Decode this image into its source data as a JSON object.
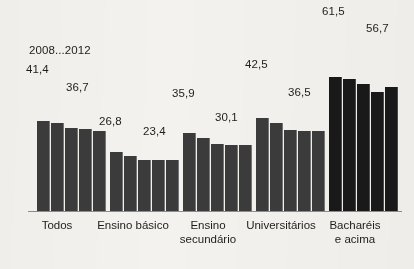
{
  "chart_data": {
    "type": "bar",
    "title": "",
    "subtitle": "",
    "xlabel": "",
    "ylabel": "",
    "legend": "2008...2012",
    "legend_position": "inside-top-left",
    "grid": false,
    "axis": {
      "baseline_visible": true,
      "y_axis_visible": false,
      "ylim": [
        0,
        70
      ]
    },
    "categories": [
      "Todos",
      "Ensino básico",
      "Ensino\nsecundário",
      "Universitários",
      "Bacharéis\ne acima"
    ],
    "series": [
      {
        "name": "2008",
        "values": [
          41.4,
          26.8,
          35.9,
          42.5,
          61.5
        ]
      },
      {
        "name": "2009",
        "values": [
          40.1,
          25.3,
          33.5,
          40.3,
          60.4
        ]
      },
      {
        "name": "2010",
        "values": [
          38.2,
          23.2,
          30.9,
          37.1,
          58.3
        ]
      },
      {
        "name": "2011",
        "values": [
          37.4,
          23.3,
          30.4,
          36.8,
          54.6
        ]
      },
      {
        "name": "2012",
        "values": [
          36.7,
          23.4,
          30.1,
          36.5,
          56.7
        ]
      }
    ],
    "groups": [
      {
        "category": "Todos",
        "dark": false,
        "first_label": "41,4",
        "last_label": "36,7",
        "values": [
          41.4,
          40.1,
          38.2,
          37.4,
          36.7
        ]
      },
      {
        "category": "Ensino básico",
        "dark": false,
        "first_label": "26,8",
        "last_label": "23,4",
        "values": [
          26.8,
          25.3,
          23.2,
          23.3,
          23.4
        ]
      },
      {
        "category": "Ensino secundário",
        "dark": false,
        "first_label": "35,9",
        "last_label": "30,1",
        "values": [
          35.9,
          33.5,
          30.9,
          30.4,
          30.1
        ]
      },
      {
        "category": "Universitários",
        "dark": false,
        "first_label": "42,5",
        "last_label": "36,5",
        "values": [
          42.5,
          40.3,
          37.1,
          36.8,
          36.5
        ]
      },
      {
        "category": "Bacharéis e acima",
        "dark": true,
        "first_label": "61,5",
        "last_label": "56,7",
        "values": [
          61.5,
          60.4,
          58.3,
          54.6,
          56.7
        ]
      }
    ],
    "colors": {
      "bar": "#3b3b3b",
      "bar_highlight": "#191919",
      "background": "#f4f2ee",
      "text": "#1d1d1d",
      "axis": "#8d8d8a"
    }
  },
  "labels": {
    "legend": "2008...2012",
    "v_41_4": "41,4",
    "v_36_7": "36,7",
    "v_26_8": "26,8",
    "v_23_4": "23,4",
    "v_35_9": "35,9",
    "v_30_1": "30,1",
    "v_42_5": "42,5",
    "v_36_5": "36,5",
    "v_61_5": "61,5",
    "v_56_7": "56,7",
    "cat_todos": "Todos",
    "cat_basico": "Ensino básico",
    "cat_secundario": "Ensino\nsecundário",
    "cat_universitarios": "Universitários",
    "cat_bachareis": "Bacharéis\ne acima"
  }
}
